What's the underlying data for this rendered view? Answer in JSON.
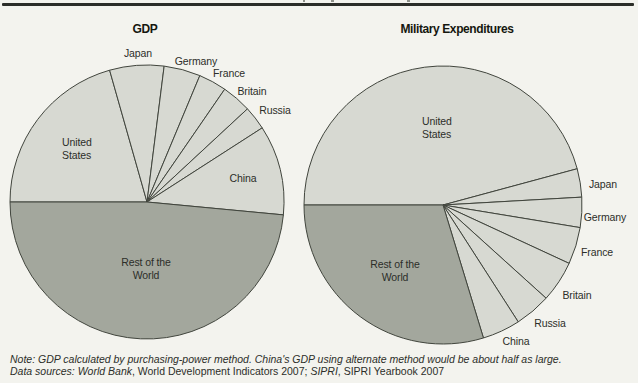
{
  "page": {
    "background": "#f3f3ee"
  },
  "colors": {
    "slice_light": "#d7d9d2",
    "slice_dark": "#a3a79d",
    "stroke": "#41453d",
    "rule": "#2b2d28"
  },
  "chart_data": [
    {
      "type": "pie",
      "title": "GDP",
      "unit": "percent of world total (purchasing-power method)",
      "start_angle_deg": 180,
      "direction": "clockwise",
      "legend_position": "on-chart labels",
      "slices": [
        {
          "label": "United States",
          "value": 20.6,
          "shade": "light"
        },
        {
          "label": "Japan",
          "value": 6.4,
          "shade": "light"
        },
        {
          "label": "Germany",
          "value": 4.3,
          "shade": "light"
        },
        {
          "label": "France",
          "value": 3.3,
          "shade": "light"
        },
        {
          "label": "Britain",
          "value": 3.5,
          "shade": "light"
        },
        {
          "label": "Russia",
          "value": 2.8,
          "shade": "light"
        },
        {
          "label": "China",
          "value": 10.6,
          "shade": "light"
        },
        {
          "label": "Rest of the World",
          "value": 48.5,
          "shade": "dark"
        }
      ]
    },
    {
      "type": "pie",
      "title": "Military Expenditures",
      "unit": "percent of world total",
      "start_angle_deg": 180,
      "direction": "clockwise",
      "legend_position": "on-chart labels",
      "slices": [
        {
          "label": "United States",
          "value": 45.8,
          "shade": "light"
        },
        {
          "label": "Japan",
          "value": 3.3,
          "shade": "light"
        },
        {
          "label": "Germany",
          "value": 3.5,
          "shade": "light"
        },
        {
          "label": "France",
          "value": 4.3,
          "shade": "light"
        },
        {
          "label": "Britain",
          "value": 4.8,
          "shade": "light"
        },
        {
          "label": "Russia",
          "value": 4.2,
          "shade": "light"
        },
        {
          "label": "China",
          "value": 4.4,
          "shade": "light"
        },
        {
          "label": "Rest of the World",
          "value": 29.7,
          "shade": "dark"
        }
      ]
    }
  ],
  "note": {
    "line1": "Note: GDP calculated by purchasing-power method. China's GDP using alternate method would be about half as large.",
    "line2": {
      "data_sources_italic": "Data sources: World Bank",
      "wdi_regular": ", World Development Indicators 2007; ",
      "sipri_italic": "SIPRI",
      "yearbook_regular": ", SIPRI Yearbook 2007"
    }
  }
}
